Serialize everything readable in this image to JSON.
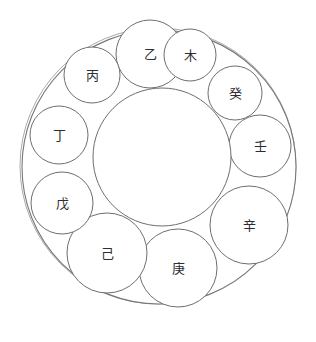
{
  "diagram": {
    "type": "circle-packing-ring",
    "colors": {
      "background": "#ffffff",
      "stroke": "#6e6e72",
      "outer_stroke": "#77777c",
      "text": "#2e2e32"
    },
    "outer_circle": {
      "name": "outer-boundary-circle",
      "cx": 159,
      "cy": 167,
      "r": 137
    },
    "outer_circle_ghost": {
      "name": "outer-boundary-circle-offset",
      "cx": 158,
      "cy": 166,
      "r": 138
    },
    "inner_circle": {
      "name": "inner-core-circle",
      "cx": 162,
      "cy": 157,
      "r": 69
    },
    "stems": [
      {
        "label": "乙",
        "romanization": "yi",
        "cx": 150,
        "cy": 54,
        "r": 34,
        "font_size": 14
      },
      {
        "label": "木",
        "romanization": "mu",
        "cx": 190,
        "cy": 55,
        "r": 26,
        "font_size": 13
      },
      {
        "label": "癸",
        "romanization": "gui",
        "cx": 235,
        "cy": 93,
        "r": 27,
        "font_size": 13
      },
      {
        "label": "壬",
        "romanization": "ren",
        "cx": 260,
        "cy": 146,
        "r": 31,
        "font_size": 14
      },
      {
        "label": "辛",
        "romanization": "xin",
        "cx": 249,
        "cy": 225,
        "r": 39,
        "font_size": 14
      },
      {
        "label": "庚",
        "romanization": "geng",
        "cx": 178,
        "cy": 268,
        "r": 39,
        "font_size": 14
      },
      {
        "label": "己",
        "romanization": "ji",
        "cx": 107,
        "cy": 253,
        "r": 40,
        "font_size": 14
      },
      {
        "label": "戊",
        "romanization": "wu",
        "cx": 62,
        "cy": 203,
        "r": 31,
        "font_size": 14
      },
      {
        "label": "丁",
        "romanization": "ding",
        "cx": 59,
        "cy": 135,
        "r": 29,
        "font_size": 14
      },
      {
        "label": "丙",
        "romanization": "bing",
        "cx": 92,
        "cy": 75,
        "r": 28,
        "font_size": 14
      }
    ]
  }
}
